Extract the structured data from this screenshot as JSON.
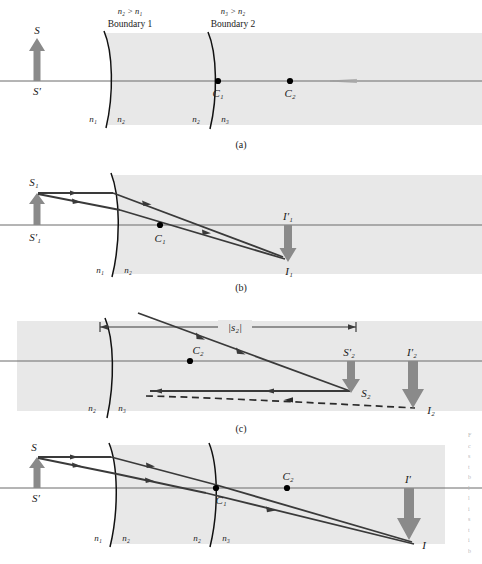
{
  "figure": {
    "type": "optics-ray-diagram",
    "colors": {
      "medium_fill": "#e8e8e8",
      "arrow_gray": "#8a8a8a",
      "ray_dark": "#3a3a3a",
      "axis": "#6a6a6a",
      "boundary": "#111111",
      "dot": "#000000",
      "page_bg": "#ffffff"
    }
  },
  "panels": [
    {
      "id": "a",
      "caption": "(a)",
      "annotations": {
        "inequality_1": "n₂ > n₁",
        "boundary_1": "Boundary 1",
        "inequality_2": "n₃ > n₂",
        "boundary_2": "Boundary 2"
      },
      "labels": {
        "object_tip": "S",
        "object_base": "S′",
        "center_1": "C₁",
        "center_2": "C₂",
        "n1": "n₁",
        "n2a": "n₂",
        "n2b": "n₂",
        "n3": "n₃"
      }
    },
    {
      "id": "b",
      "caption": "(b)",
      "labels": {
        "object_tip": "S₁",
        "object_base": "S′₁",
        "center_1": "C₁",
        "image_base": "I′₁",
        "image_tip": "I₁",
        "n1": "n₁",
        "n2": "n₂"
      }
    },
    {
      "id": "c",
      "caption": "(c)",
      "labels": {
        "distance": "|s₂|",
        "center_2": "C₂",
        "object_base": "S′₂",
        "object_tip": "S₂",
        "image_base": "I′₂",
        "image_tip": "I₂",
        "n2": "n₂",
        "n3": "n₃"
      }
    },
    {
      "id": "d",
      "caption": "(d)",
      "labels": {
        "object_tip": "S",
        "object_base": "S′",
        "center_1": "C₁",
        "center_2": "C₂",
        "image_base": "I′",
        "image_tip": "I",
        "n1": "n₁",
        "n2a": "n₂",
        "n2b": "n₂",
        "n3": "n₃"
      }
    }
  ],
  "margin_text": {
    "fragments": [
      "F",
      "c",
      "s",
      "t",
      "b",
      "l",
      "l",
      "i",
      "s",
      "t",
      "i",
      "b"
    ]
  }
}
